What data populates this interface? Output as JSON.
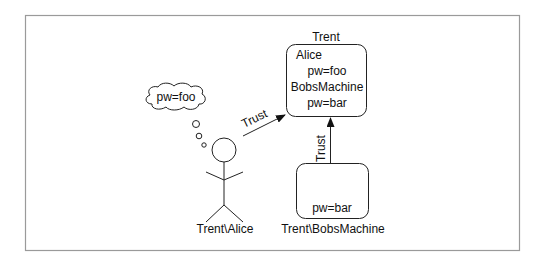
{
  "diagram": {
    "frame_color": "#9a9a9a",
    "line_color": "#222222",
    "trent_box": {
      "title": "Trent",
      "lines": [
        "Alice",
        "pw=foo",
        "BobsMachine",
        "pw=bar"
      ]
    },
    "bobs_machine_box": {
      "content": "pw=bar",
      "label": "Trent\\BobsMachine"
    },
    "user": {
      "label": "Trent\\Alice",
      "thought": "pw=foo"
    },
    "arrows": {
      "alice_to_trent": "Trust",
      "machine_to_trent": "Trust"
    }
  }
}
